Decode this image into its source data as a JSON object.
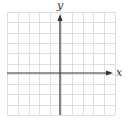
{
  "diagram": {
    "type": "coordinate-grid",
    "x_axis_label": "x",
    "y_axis_label": "y",
    "grid": {
      "columns": 10,
      "rows": 10,
      "left_px": 7,
      "top_px": 12,
      "right_px": 115,
      "bottom_px": 115,
      "line_color": "#d6d6d6"
    },
    "axes": {
      "color": "#333333",
      "x_axis_y_px": 73,
      "y_axis_x_px": 60,
      "x_arrow": "right",
      "y_arrow": "up"
    },
    "tick_labels": []
  }
}
